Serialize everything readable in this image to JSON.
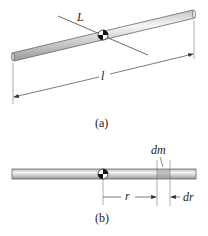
{
  "figure_a": {
    "axis_label": "L",
    "length_label": "l",
    "caption": "(a)"
  },
  "figure_b": {
    "mass_element_label": "dm",
    "radius_label": "r",
    "width_label": "dr",
    "caption": "(b)"
  },
  "colors": {
    "rod_fill": "#d9d9d9",
    "rod_highlight": "#f2f2f2",
    "rod_edge": "#555555",
    "line": "#444444",
    "mass_element": "#a8a8a8"
  }
}
